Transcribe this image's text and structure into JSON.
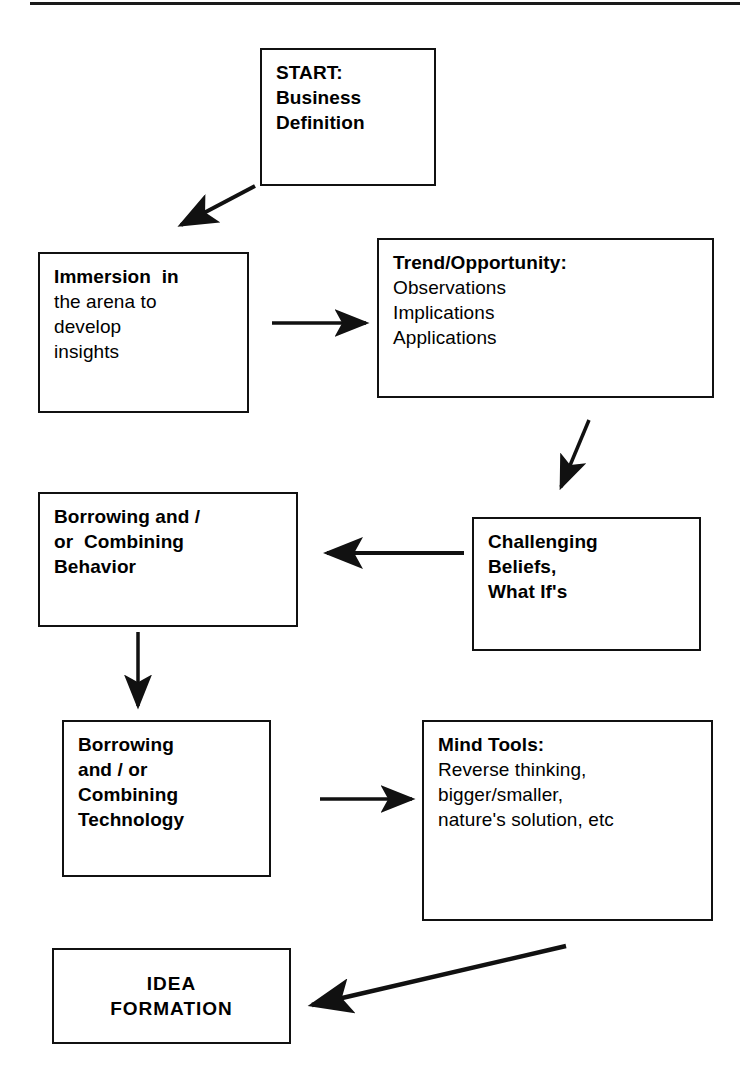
{
  "diagram": {
    "rule": {
      "present": true
    },
    "colors": {
      "stroke": "#111111",
      "text": "#000000",
      "background": "#ffffff"
    },
    "nodes": [
      {
        "id": "start",
        "name": "start-business-definition",
        "lines": [
          {
            "text": "START:",
            "bold": true
          },
          {
            "text": "Business",
            "bold": true
          },
          {
            "text": "Definition",
            "bold": true
          }
        ]
      },
      {
        "id": "immersion",
        "name": "immersion-in-arena",
        "lines": [
          {
            "text": "Immersion  in",
            "bold": true
          },
          {
            "text": "the arena to",
            "bold": false
          },
          {
            "text": "develop",
            "bold": false
          },
          {
            "text": "insights",
            "bold": false
          }
        ]
      },
      {
        "id": "trend",
        "name": "trend-opportunity",
        "lines": [
          {
            "text": "Trend/Opportunity:",
            "bold": true
          },
          {
            "text": "Observations",
            "bold": false
          },
          {
            "text": "Implications",
            "bold": false
          },
          {
            "text": "Applications",
            "bold": false
          }
        ]
      },
      {
        "id": "challenging",
        "name": "challenging-beliefs",
        "lines": [
          {
            "text": "Challenging",
            "bold": true
          },
          {
            "text": "Beliefs,",
            "bold": true
          },
          {
            "text": "What If's",
            "bold": true
          }
        ]
      },
      {
        "id": "borrow-behavior",
        "name": "borrowing-combining-behavior",
        "lines": [
          {
            "text": "Borrowing and /",
            "bold": true
          },
          {
            "text": "or  Combining",
            "bold": true
          },
          {
            "text": "Behavior",
            "bold": true
          }
        ]
      },
      {
        "id": "borrow-technology",
        "name": "borrowing-combining-technology",
        "lines": [
          {
            "text": "Borrowing",
            "bold": true
          },
          {
            "text": "and / or",
            "bold": true
          },
          {
            "text": "Combining",
            "bold": true
          },
          {
            "text": "Technology",
            "bold": true
          }
        ]
      },
      {
        "id": "mind-tools",
        "name": "mind-tools",
        "lines": [
          {
            "text": "Mind Tools:",
            "bold": true
          },
          {
            "text": "Reverse thinking,",
            "bold": false
          },
          {
            "text": "bigger/smaller,",
            "bold": false
          },
          {
            "text": "nature's solution, etc",
            "bold": false
          }
        ]
      },
      {
        "id": "idea-formation",
        "name": "idea-formation",
        "lines": [
          {
            "text": "IDEA",
            "bold": true
          },
          {
            "text": "FORMATION",
            "bold": true
          }
        ]
      }
    ],
    "edges": [
      {
        "from": "start",
        "to": "immersion",
        "style": "diagonal-down-left"
      },
      {
        "from": "immersion",
        "to": "trend",
        "style": "horizontal-right"
      },
      {
        "from": "trend",
        "to": "challenging",
        "style": "diagonal-down-left"
      },
      {
        "from": "challenging",
        "to": "borrow-behavior",
        "style": "horizontal-left"
      },
      {
        "from": "borrow-behavior",
        "to": "borrow-technology",
        "style": "vertical-down"
      },
      {
        "from": "borrow-technology",
        "to": "mind-tools",
        "style": "horizontal-right"
      },
      {
        "from": "mind-tools",
        "to": "idea-formation",
        "style": "diagonal-down-left"
      }
    ]
  }
}
